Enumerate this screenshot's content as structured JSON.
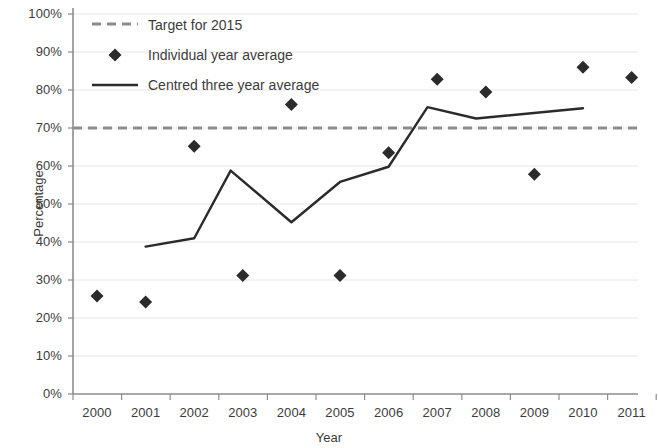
{
  "chart_data": {
    "type": "line",
    "title": "",
    "xlabel": "Year",
    "ylabel": "Percentage",
    "xlim": [
      1999.5,
      2011.5
    ],
    "ylim": [
      0,
      100
    ],
    "ytick_format": "percent",
    "grid": "horizontal",
    "legend_position": "top-left",
    "categories": [
      2000,
      2001,
      2002,
      2003,
      2004,
      2005,
      2006,
      2007,
      2008,
      2009,
      2010,
      2011
    ],
    "xticklabels": [
      "2000",
      "2001",
      "2002",
      "2003",
      "2004",
      "2005",
      "2006",
      "2007",
      "2008",
      "2009",
      "2010",
      "2011"
    ],
    "yticklabels": [
      "0%",
      "10%",
      "20%",
      "30%",
      "40%",
      "50%",
      "60%",
      "70%",
      "80%",
      "90%",
      "100%"
    ],
    "ytickvalues": [
      0,
      10,
      20,
      30,
      40,
      50,
      60,
      70,
      80,
      90,
      100
    ],
    "series": [
      {
        "name": "Target for 2015",
        "type": "hline",
        "style": "dashed",
        "color": "#8c8c8c",
        "value": 70
      },
      {
        "name": "Individual year average",
        "type": "scatter",
        "marker": "diamond",
        "color": "#2b2b2b",
        "x": [
          2000,
          2001,
          2002,
          2003,
          2004,
          2005,
          2006,
          2007,
          2008,
          2009,
          2010,
          2011
        ],
        "values": [
          25.8,
          24.2,
          65.2,
          31.2,
          76.2,
          31.2,
          63.5,
          82.8,
          79.5,
          57.8,
          86.0,
          83.3
        ]
      },
      {
        "name": "Centred three year average",
        "type": "line",
        "style": "solid",
        "color": "#2b2b2b",
        "x": [
          2001,
          2002,
          2002.75,
          2004,
          2005,
          2006,
          2006.8,
          2007.8,
          2010
        ],
        "values": [
          38.8,
          41.0,
          58.8,
          45.2,
          55.8,
          59.8,
          75.5,
          72.5,
          75.2
        ]
      }
    ],
    "legend": [
      {
        "label": "Target for 2015",
        "marker": "dashed-line",
        "color": "#8c8c8c"
      },
      {
        "label": "Individual year average",
        "marker": "diamond",
        "color": "#2b2b2b"
      },
      {
        "label": "Centred three year average",
        "marker": "solid-line",
        "color": "#2b2b2b"
      }
    ]
  }
}
